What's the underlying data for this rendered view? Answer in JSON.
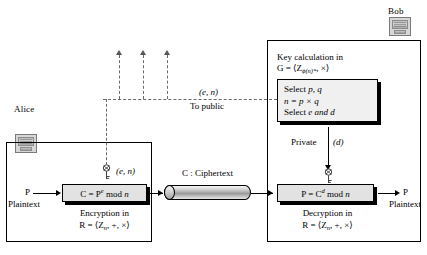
{
  "diagram": {
    "parties": {
      "alice": {
        "label": "Alice",
        "icon": "computer-icon"
      },
      "bob": {
        "label": "Bob",
        "icon": "computer-icon"
      }
    },
    "alice_side": {
      "input_label": "P",
      "input_caption": "Plaintext",
      "key_label": "(e, n)",
      "key_icon": "key-icon",
      "process_formula": "C = Pᵉ mod n",
      "process_formula_parts": {
        "lhs": "C = P",
        "exponent": "e",
        "rhs": " mod ",
        "modulus": "n"
      },
      "caption_line1": "Encryption in",
      "caption_line2": "R = ⟨Zₙ, +, ×⟩",
      "caption_line2_parts": {
        "prefix": "R = ⟨Z",
        "subscript": "n",
        "suffix": ", +, ×⟩"
      }
    },
    "channel": {
      "label": "C : Ciphertext",
      "shape": "cylinder"
    },
    "public_channel": {
      "key_label": "(e, n)",
      "caption": "To public",
      "arrow_count": 3,
      "line_style": "dashed"
    },
    "bob_side": {
      "key_calc_line1": "Key calculation in",
      "key_calc_line2_parts": {
        "prefix": "G = ⟨Z",
        "subscript": "ϕ(n)*",
        "suffix": ", ×⟩"
      },
      "key_calc_line2": "G = ⟨Zϕ(n)*, ×⟩",
      "steps": [
        {
          "text_prefix": "Select ",
          "text_italic": "p, q",
          "text_suffix": ""
        },
        {
          "text_prefix": "",
          "text_italic": "n",
          "text_suffix": " = p × q"
        },
        {
          "text_prefix": "Select  ",
          "text_italic": "e",
          "text_suffix": " and d"
        }
      ],
      "step_lines": [
        "Select p, q",
        "n =  p × q",
        "Select  e and d"
      ],
      "private_label": "Private",
      "private_key_label": "(d)",
      "key_icon": "key-icon",
      "process_formula": "P = Cᵈ mod n",
      "process_formula_parts": {
        "lhs": "P = C",
        "exponent": "d",
        "rhs": " mod ",
        "modulus": "n"
      },
      "caption_line1": "Decryption in",
      "caption_line2": "R = ⟨Zₙ, +, ×⟩",
      "caption_line2_parts": {
        "prefix": "R = ⟨Z",
        "subscript": "n",
        "suffix": ", +, ×⟩"
      },
      "output_label": "P",
      "output_caption": "Plaintext"
    },
    "colors": {
      "line": "#000000",
      "dashed_line": "#6b6b6b",
      "box_fill": "#e2e2e2",
      "step_box_fill": "#f0f0f0",
      "background": "#ffffff"
    }
  }
}
